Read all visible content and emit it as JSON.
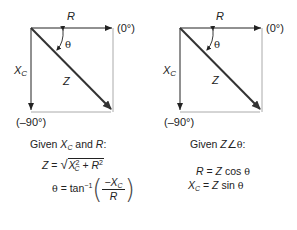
{
  "left_diagram": {
    "labels": {
      "r": "R",
      "zero_deg": "(0°)",
      "theta": "θ",
      "xc_main": "X",
      "xc_sub": "C",
      "z": "Z",
      "minus90": "(–90°)"
    },
    "caption": {
      "prefix": "Given ",
      "xc_main": "X",
      "xc_sub": "C",
      "middle": " and ",
      "r": "R",
      "suffix": ":"
    },
    "equations": {
      "eq1": {
        "lhs": "Z",
        "eq": " = ",
        "sqrt_xc": "X",
        "sqrt_xc_sub": "C",
        "sqrt_xc_sup": "2",
        "plus": " + ",
        "sqrt_r": "R",
        "sqrt_r_sup": "2"
      },
      "eq2": {
        "lhs": "θ",
        "eq": " = tan",
        "sup": "−1",
        "num_minus": "−",
        "num_x": "X",
        "num_sub": "C",
        "den": "R"
      }
    }
  },
  "right_diagram": {
    "labels": {
      "r": "R",
      "zero_deg": "(0°)",
      "theta": "θ",
      "xc_main": "X",
      "xc_sub": "C",
      "z": "Z",
      "minus90": "(–90°)"
    },
    "caption": {
      "prefix": "Given ",
      "z": "Z",
      "angle": "∠",
      "theta": "θ",
      "suffix": ":"
    },
    "equations": {
      "eq1": {
        "lhs": "R",
        "eq": " = ",
        "z": "Z",
        "func": " cos ",
        "theta": "θ"
      },
      "eq2": {
        "lhs_main": "X",
        "lhs_sub": "C",
        "eq": " = ",
        "z": "Z",
        "func": " sin ",
        "theta": "θ"
      }
    }
  },
  "colors": {
    "line": "#222222",
    "frame": "#aaaaaa",
    "vector_z": "#333333"
  }
}
